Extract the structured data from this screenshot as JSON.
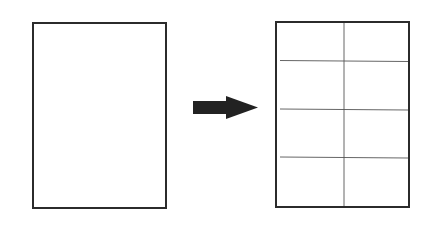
{
  "diagram": {
    "colors": {
      "stroke": "#2b2b2b",
      "grid_line": "#555555",
      "arrow": "#222222",
      "background": "#ffffff"
    },
    "source_page": {
      "label": ""
    },
    "arrow": {
      "direction": "right"
    },
    "result_page": {
      "columns": 2,
      "rows": 4,
      "cells": 8
    }
  }
}
